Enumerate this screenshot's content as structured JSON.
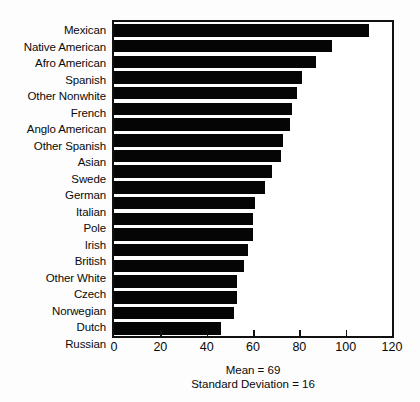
{
  "chart_data": {
    "type": "bar",
    "orientation": "horizontal",
    "title": "",
    "xlabel": "",
    "ylabel": "",
    "xlim": [
      0,
      120
    ],
    "grid": false,
    "legend": null,
    "xticks": [
      0,
      20,
      40,
      60,
      80,
      100,
      120
    ],
    "xtick_labels": [
      "0",
      "20",
      "40",
      "60",
      "80",
      "100",
      "120"
    ],
    "categories": [
      "Mexican",
      "Native American",
      "Afro American",
      "Spanish",
      "Other Nonwhite",
      "French",
      "Anglo American",
      "Other Spanish",
      "Asian",
      "Swede",
      "German",
      "Italian",
      "Pole",
      "Irish",
      "British",
      "Other White",
      "Czech",
      "Norwegian",
      "Dutch",
      "Russian"
    ],
    "values": [
      110,
      94,
      87,
      81,
      79,
      77,
      76,
      73,
      72,
      68,
      65,
      61,
      60,
      60,
      58,
      56,
      53,
      53,
      52,
      46
    ],
    "annotations": [
      "Mean = 69",
      "Standard Deviation = 16"
    ],
    "bar_color": "#050505",
    "frame_color": "#111111",
    "background_color": "#ffffff"
  },
  "footnote": {
    "mean_line": "Mean = 69",
    "stddev_line": "Standard Deviation = 16"
  },
  "title_remnant": ""
}
